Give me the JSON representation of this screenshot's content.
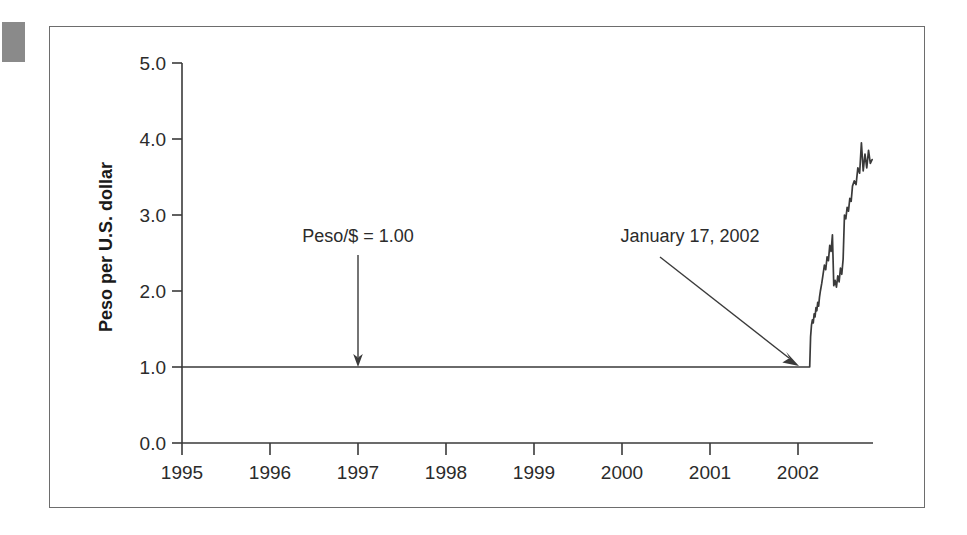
{
  "figure": {
    "corner_mark_color": "#8a8a8a",
    "frame_color": "#6d6d6d",
    "background": "#ffffff"
  },
  "chart_data": {
    "type": "line",
    "title": "",
    "subtitle": "",
    "xlabel": "",
    "ylabel": "Peso per U.S. dollar",
    "xlim": [
      1995,
      2002.75
    ],
    "ylim": [
      0.0,
      5.0
    ],
    "grid": false,
    "legend": null,
    "line_color": "#3a3a3a",
    "xticks": [
      1995,
      1996,
      1997,
      1998,
      1999,
      2000,
      2001,
      2002
    ],
    "xtick_labels": [
      "1995",
      "1996",
      "1997",
      "1998",
      "1999",
      "2000",
      "2001",
      "2002"
    ],
    "yticks": [
      0.0,
      1.0,
      2.0,
      3.0,
      4.0,
      5.0
    ],
    "ytick_labels": [
      "0.0",
      "1.0",
      "2.0",
      "3.0",
      "4.0",
      "5.0"
    ],
    "series": [
      {
        "name": "Argentine peso per U.S. dollar",
        "x": [
          1995.0,
          1995.5,
          1996.0,
          1996.5,
          1997.0,
          1997.5,
          1998.0,
          1998.5,
          1999.0,
          1999.5,
          2000.0,
          2000.5,
          2001.0,
          2001.5,
          2001.9,
          2002.04,
          2002.05,
          2002.06,
          2002.07,
          2002.08,
          2002.09,
          2002.1,
          2002.11,
          2002.12,
          2002.13,
          2002.14,
          2002.15,
          2002.16,
          2002.175,
          2002.19,
          2002.205,
          2002.22,
          2002.235,
          2002.25,
          2002.265,
          2002.28,
          2002.295,
          2002.31,
          2002.325,
          2002.34,
          2002.355,
          2002.37,
          2002.385,
          2002.4,
          2002.415,
          2002.43,
          2002.445,
          2002.46,
          2002.475,
          2002.49,
          2002.505,
          2002.52,
          2002.54,
          2002.56,
          2002.58,
          2002.6,
          2002.62,
          2002.64,
          2002.66,
          2002.68,
          2002.7,
          2002.72,
          2002.74
        ],
        "y": [
          1.0,
          1.0,
          1.0,
          1.0,
          1.0,
          1.0,
          1.0,
          1.0,
          1.0,
          1.0,
          1.0,
          1.0,
          1.0,
          1.0,
          1.0,
          1.0,
          1.4,
          1.55,
          1.62,
          1.58,
          1.7,
          1.66,
          1.78,
          1.74,
          1.85,
          1.8,
          1.92,
          2.0,
          2.1,
          2.22,
          2.34,
          2.28,
          2.45,
          2.4,
          2.6,
          2.52,
          2.74,
          2.07,
          2.14,
          2.05,
          2.2,
          2.12,
          2.3,
          2.22,
          2.42,
          3.0,
          2.95,
          3.1,
          3.05,
          3.22,
          3.18,
          3.38,
          3.45,
          3.4,
          3.62,
          3.55,
          3.95,
          3.58,
          3.8,
          3.62,
          3.85,
          3.68,
          3.73
        ]
      }
    ],
    "annotations": [
      {
        "id": "peso-parity",
        "text": "Peso/$ = 1.00",
        "text_x": 1997.0,
        "text_y": 2.65,
        "arrow_from": [
          1997.0,
          2.45
        ],
        "arrow_to": [
          1997.0,
          1.05
        ]
      },
      {
        "id": "devaluation-date",
        "text": "January 17, 2002",
        "text_x": 2000.7,
        "text_y": 2.65,
        "arrow_from": [
          2000.2,
          2.38
        ],
        "arrow_to": [
          2002.02,
          1.04
        ]
      }
    ]
  }
}
